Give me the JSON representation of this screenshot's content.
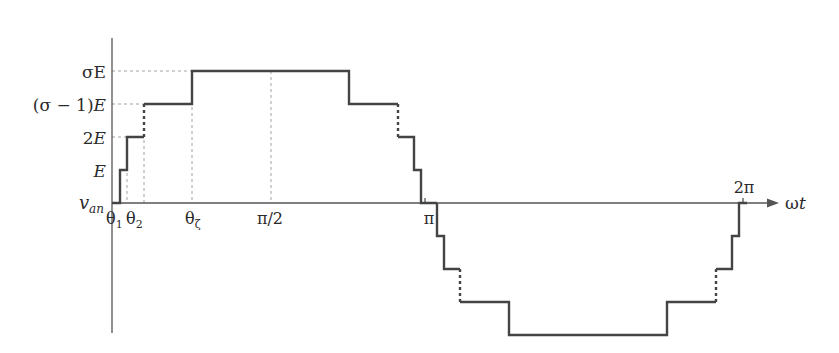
{
  "diagram": {
    "y_axis_label": {
      "main": "v",
      "sub": "an"
    },
    "x_axis_label": {
      "main": "ω",
      "italic": "t"
    },
    "y_levels": [
      {
        "label": "σE",
        "value": "σE"
      },
      {
        "label": "(σ − 1)E",
        "value": "(σ−1)E"
      },
      {
        "label": "2E",
        "value": "2E"
      },
      {
        "label": "E",
        "value": "E"
      }
    ],
    "x_ticks": [
      {
        "label": "θ",
        "sub": "1"
      },
      {
        "label": "θ",
        "sub": "2"
      },
      {
        "label": "θ",
        "sub": "ζ"
      },
      {
        "label": "π/2"
      },
      {
        "label": "π"
      },
      {
        "label": "2π"
      }
    ],
    "labels": {
      "sigmaE": "σE",
      "sigma_minus_1_E_open": "(σ − 1)",
      "sigma_minus_1_E_E": "E",
      "twoE_num": "2",
      "twoE_E": "E",
      "E": "E",
      "theta1": "θ",
      "theta1_sub": "1",
      "theta2": "θ",
      "theta2_sub": "2",
      "thetaZ": "θ",
      "thetaZ_sub": "ζ",
      "half_pi": "π/2",
      "pi": "π",
      "two_pi": "2π",
      "omega": "ω",
      "t": "t",
      "v": "v",
      "an": "an"
    },
    "colors": {
      "waveform": "#444444",
      "guides": "#8a8a8a",
      "axis": "#555555",
      "text": "#2a2a2a"
    }
  }
}
